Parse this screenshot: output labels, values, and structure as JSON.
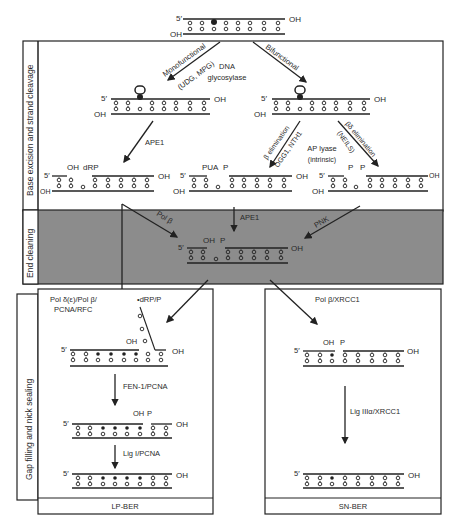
{
  "top_dna": {
    "five_prime": "5′",
    "oh_top": "OH",
    "oh_bottom": "OH"
  },
  "sections": {
    "base_excision": {
      "label": "Base excision and strand cleavage",
      "monofunctional": "Monofunctional",
      "mono_enzymes": "(UDG, MPG)",
      "dna": "DNA",
      "glycosylase": "glycosylase",
      "bifunctional": "Bifunctional",
      "ape1": "APE1",
      "beta_elim": "β elimination",
      "beta_enzymes": "OGG1, NTH1",
      "ap_lyase": "AP lyase",
      "intrinsic": "(intrinsic)",
      "betadelta_elim": "βδ elimination",
      "neil": "(NEILS)",
      "products": [
        {
          "left": "OH",
          "right": "dRP"
        },
        {
          "left": "PUA",
          "right": "P"
        },
        {
          "left": "P",
          "right": "P"
        }
      ],
      "five_prime": "5′",
      "oh": "OH"
    },
    "end_cleaning": {
      "label": "End cleaning",
      "pol_beta": "Pol β",
      "ape1": "APE1",
      "pnk": "PNK",
      "gap_left": "OH",
      "gap_right": "P",
      "five_prime": "5′",
      "oh": "OH"
    },
    "gap_filling": {
      "label": "Gap filling and nick sealing",
      "lp": {
        "polymerase": "Pol δ(ε)/Pol β/",
        "polymerase2": "PCNA/RFC",
        "flap": "•dRP/P",
        "flap_oh": "OH",
        "fen": "FEN-1/PCNA",
        "nick_oh": "OH",
        "nick_p": "P",
        "ligase": "Lig I/PCNA",
        "footer": "LP-BER"
      },
      "sn": {
        "polymerase": "Pol β/XRCC1",
        "nick_oh": "OH",
        "nick_p": "P",
        "ligase": "Lig IIIα/XRCC1",
        "footer": "SN-BER"
      },
      "five_prime": "5′",
      "oh": "OH"
    }
  },
  "colors": {
    "end_cleaning_bg": "#8c8c8c",
    "line": "#222222"
  }
}
